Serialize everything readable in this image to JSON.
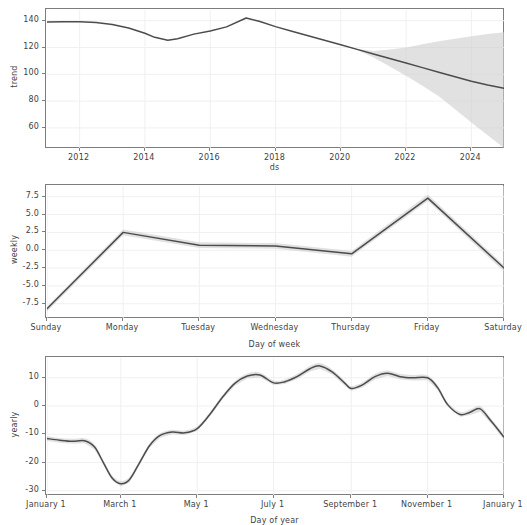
{
  "figure": {
    "title": "",
    "background": "#ffffff",
    "line_color": "#4c4c4c",
    "band_color": "#cfcfcf",
    "grid_color": "#f0f0f0",
    "spine_color": "#7d7d7d",
    "width": 514,
    "height": 525
  },
  "panels": [
    {
      "name": "trend",
      "ylabel": "trend",
      "xlabel": "ds",
      "yticks": [
        "60",
        "80",
        "100",
        "120",
        "140"
      ],
      "xticks": [
        "2012",
        "2014",
        "2016",
        "2018",
        "2020",
        "2022",
        "2024"
      ]
    },
    {
      "name": "weekly",
      "ylabel": "weekly",
      "xlabel": "Day of week",
      "yticks": [
        "-7.5",
        "-5.0",
        "-2.5",
        "0.0",
        "2.5",
        "5.0",
        "7.5"
      ],
      "xticks": [
        "Sunday",
        "Monday",
        "Tuesday",
        "Wednesday",
        "Thursday",
        "Friday",
        "Saturday"
      ]
    },
    {
      "name": "yearly",
      "ylabel": "yearly",
      "xlabel": "Day of year",
      "yticks": [
        "-30",
        "-20",
        "-10",
        "0",
        "10"
      ],
      "xticks": [
        "January 1",
        "March 1",
        "May 1",
        "July 1",
        "September 1",
        "November 1",
        "January 1"
      ]
    }
  ],
  "chart_data": [
    {
      "type": "line",
      "name": "trend",
      "title": "",
      "xlabel": "ds",
      "ylabel": "trend",
      "xlim": [
        2011.0,
        2025.0
      ],
      "ylim": [
        45.0,
        148.0
      ],
      "xticks": [
        2012,
        2014,
        2016,
        2018,
        2020,
        2022,
        2024
      ],
      "xticklabels": [
        "2012",
        "2014",
        "2016",
        "2018",
        "2020",
        "2022",
        "2024"
      ],
      "yticks": [
        60,
        80,
        100,
        120,
        140
      ],
      "grid": true,
      "x": [
        2011.0,
        2011.5,
        2012.0,
        2012.5,
        2013.0,
        2013.5,
        2014.0,
        2014.3,
        2014.7,
        2015.0,
        2015.5,
        2016.0,
        2016.5,
        2017.1,
        2017.5,
        2018.0,
        2018.5,
        2019.0,
        2019.5,
        2020.0,
        2020.5,
        2021.0,
        2021.5,
        2022.0,
        2022.5,
        2023.0,
        2023.5,
        2024.0,
        2024.5,
        2025.0
      ],
      "y": [
        139.0,
        139.3,
        139.2,
        138.6,
        137.2,
        134.6,
        130.6,
        127.6,
        125.5,
        126.6,
        130.0,
        132.4,
        135.4,
        142.0,
        139.6,
        135.6,
        132.2,
        128.8,
        125.4,
        122.0,
        118.6,
        115.2,
        111.8,
        108.4,
        105.0,
        101.6,
        98.2,
        94.8,
        92.0,
        89.6
      ],
      "uncertainty_start": 2020.6,
      "y_upper": [
        139.0,
        139.3,
        139.2,
        138.6,
        137.2,
        134.6,
        130.6,
        127.6,
        125.5,
        126.6,
        130.0,
        132.4,
        135.4,
        142.0,
        139.6,
        135.6,
        132.2,
        128.8,
        125.4,
        122.0,
        119.0,
        117.4,
        118.6,
        120.0,
        122.5,
        124.6,
        126.5,
        128.4,
        130.0,
        131.3
      ],
      "y_lower": [
        139.0,
        139.3,
        139.2,
        138.6,
        137.2,
        134.6,
        130.6,
        127.6,
        125.5,
        126.6,
        130.0,
        132.4,
        135.4,
        142.0,
        139.6,
        135.6,
        132.2,
        128.8,
        125.4,
        122.0,
        118.2,
        112.6,
        105.8,
        99.0,
        91.4,
        83.6,
        74.0,
        64.0,
        54.5,
        45.0
      ]
    },
    {
      "type": "line",
      "name": "weekly",
      "title": "",
      "xlabel": "Day of week",
      "ylabel": "weekly",
      "ylim": [
        -9.5,
        9.0
      ],
      "yticks": [
        -7.5,
        -5.0,
        -2.5,
        0.0,
        2.5,
        5.0,
        7.5
      ],
      "grid": true,
      "categories": [
        "Sunday",
        "Monday",
        "Tuesday",
        "Wednesday",
        "Thursday",
        "Friday",
        "Saturday"
      ],
      "values": [
        -8.2,
        2.5,
        0.7,
        0.6,
        -0.5,
        7.3,
        -2.5
      ],
      "values_upper": [
        -7.9,
        2.9,
        1.1,
        1.0,
        -0.1,
        7.8,
        -2.1
      ],
      "values_lower": [
        -8.6,
        2.1,
        0.3,
        0.2,
        -0.9,
        6.9,
        -3.0
      ]
    },
    {
      "type": "line",
      "name": "yearly",
      "title": "",
      "xlabel": "Day of year",
      "ylabel": "yearly",
      "xlim": [
        0,
        365
      ],
      "ylim": [
        -31.5,
        17.0
      ],
      "yticks": [
        -30,
        -20,
        -10,
        0,
        10
      ],
      "xticks": [
        0,
        59,
        120,
        181,
        243,
        304,
        365
      ],
      "xticklabels": [
        "January 1",
        "March 1",
        "May 1",
        "July 1",
        "September 1",
        "November 1",
        "January 1"
      ],
      "grid": true,
      "x": [
        0,
        10,
        20,
        30,
        38,
        45,
        52,
        59,
        66,
        74,
        82,
        90,
        100,
        110,
        120,
        130,
        140,
        150,
        160,
        170,
        181,
        190,
        200,
        210,
        218,
        228,
        238,
        243,
        252,
        262,
        272,
        282,
        292,
        304,
        312,
        320,
        330,
        338,
        346,
        355,
        365
      ],
      "y": [
        -11.5,
        -12.1,
        -12.5,
        -12.3,
        -14.5,
        -20.0,
        -25.5,
        -27.5,
        -26.0,
        -20.0,
        -14.0,
        -10.5,
        -9.2,
        -9.5,
        -8.0,
        -3.0,
        3.0,
        8.0,
        10.6,
        11.0,
        8.2,
        8.6,
        10.5,
        13.2,
        14.2,
        12.0,
        8.0,
        6.2,
        7.5,
        10.4,
        11.6,
        10.4,
        10.0,
        10.0,
        6.5,
        0.5,
        -3.0,
        -2.2,
        -1.0,
        -5.5,
        -11.0
      ],
      "y_upper": [
        -10.6,
        -11.3,
        -11.6,
        -11.4,
        -13.6,
        -19.2,
        -24.6,
        -26.5,
        -25.0,
        -19.2,
        -13.2,
        -9.7,
        -8.4,
        -8.7,
        -7.2,
        -2.2,
        3.8,
        8.8,
        11.5,
        11.9,
        9.0,
        9.4,
        11.4,
        14.2,
        15.2,
        12.9,
        8.9,
        7.1,
        8.4,
        11.4,
        12.6,
        11.4,
        11.0,
        10.9,
        7.4,
        1.3,
        -2.1,
        -1.2,
        0.0,
        -4.6,
        -10.0
      ],
      "y_lower": [
        -12.4,
        -13.0,
        -13.4,
        -13.2,
        -15.4,
        -20.8,
        -26.4,
        -28.5,
        -27.0,
        -20.8,
        -14.8,
        -11.3,
        -10.0,
        -10.3,
        -8.8,
        -3.8,
        2.2,
        7.2,
        9.7,
        10.1,
        7.4,
        7.8,
        9.6,
        12.2,
        13.2,
        11.1,
        7.1,
        5.3,
        6.6,
        9.4,
        10.6,
        9.4,
        9.0,
        9.1,
        5.6,
        -0.3,
        -3.9,
        -3.2,
        -2.0,
        -6.4,
        -12.0
      ]
    }
  ]
}
